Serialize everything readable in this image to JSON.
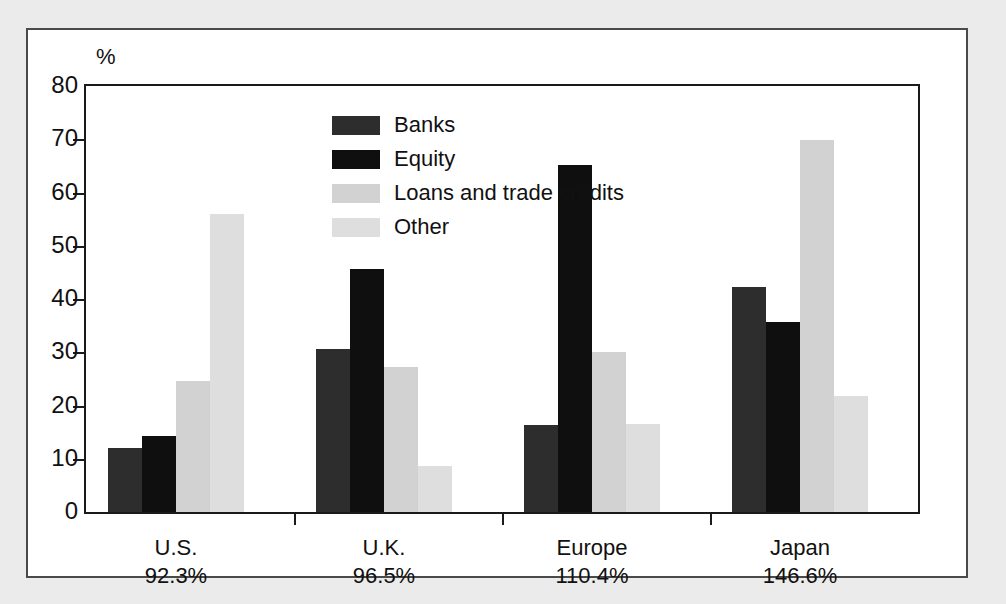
{
  "chart_data": {
    "type": "bar",
    "title": "",
    "subtitle": "",
    "xlabel": "",
    "ylabel": "%",
    "ylim": [
      0,
      80
    ],
    "yticks": [
      0,
      10,
      20,
      30,
      40,
      50,
      60,
      70,
      80
    ],
    "ytick_labels": [
      "0",
      "10",
      "20",
      "30",
      "40",
      "50",
      "60",
      "70",
      "80"
    ],
    "grid": false,
    "legend_position": "inside-top-left",
    "categories": [
      "U.S.",
      "U.K.",
      "Europe",
      "Japan"
    ],
    "category_sublabels": [
      "92.3%",
      "96.5%",
      "110.4%",
      "146.6%"
    ],
    "series": [
      {
        "name": "Banks",
        "color": "#2d2d2d",
        "values": [
          12.0,
          30.6,
          16.4,
          42.2
        ]
      },
      {
        "name": "Equity",
        "color": "#0f0f0f",
        "values": [
          14.3,
          45.6,
          65.2,
          35.6
        ]
      },
      {
        "name": "Loans and trade credits",
        "color": "#d2d2d2",
        "values": [
          24.6,
          27.2,
          30.0,
          69.9
        ]
      },
      {
        "name": "Other",
        "color": "#dedede",
        "values": [
          56.0,
          8.6,
          16.6,
          21.7
        ]
      }
    ],
    "annotations": []
  },
  "legend": {
    "items": [
      {
        "label": "Banks"
      },
      {
        "label": "Equity"
      },
      {
        "label": "Loans and trade credits"
      },
      {
        "label": "Other"
      }
    ]
  }
}
